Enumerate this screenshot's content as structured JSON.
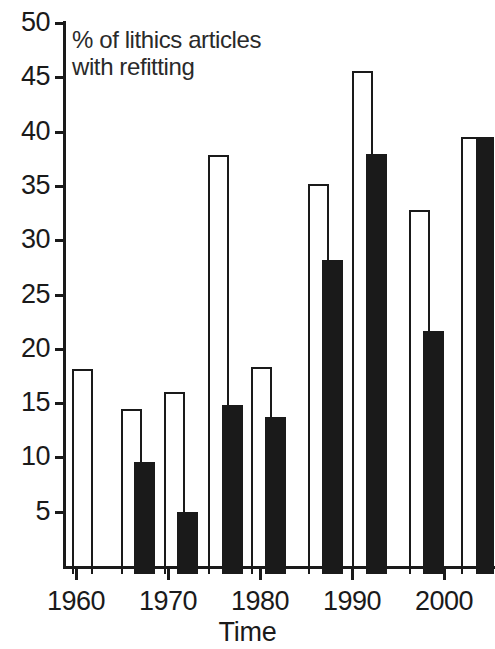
{
  "chart_data": {
    "type": "bar",
    "title": "",
    "annotation": "% of lithics articles with refitting",
    "xlabel": "Time",
    "ylabel": "",
    "xlim": [
      1958,
      2005
    ],
    "ylim": [
      0,
      50
    ],
    "y_ticks": [
      5,
      10,
      15,
      20,
      25,
      30,
      35,
      40,
      45,
      50
    ],
    "y_tick_labels": [
      "5",
      "10",
      "15",
      "20",
      "25",
      "30",
      "35",
      "40",
      "45",
      "50"
    ],
    "x_ticks": [
      1960,
      1970,
      1980,
      1990,
      2000
    ],
    "x_tick_labels": [
      "1960",
      "1970",
      "1980",
      "1990",
      "2000"
    ],
    "grid": false,
    "legend": "none",
    "series": [
      {
        "name": "open",
        "style": "open",
        "points": [
          {
            "x": 1961.5,
            "y": 18.9
          },
          {
            "x": 1966.9,
            "y": 15.2
          },
          {
            "x": 1971.6,
            "y": 16.8
          },
          {
            "x": 1976.4,
            "y": 38.6
          },
          {
            "x": 1981.1,
            "y": 19.1
          },
          {
            "x": 1986.6,
            "y": 35.9
          },
          {
            "x": 1991.3,
            "y": 46.3
          },
          {
            "x": 1996.4,
            "y": 33.5
          },
          {
            "x": 2001.8,
            "y": 40.2
          }
        ]
      },
      {
        "name": "filled",
        "style": "filled",
        "points": [
          {
            "x": 1968.3,
            "y": 10.3
          },
          {
            "x": 1973.0,
            "y": 5.7
          },
          {
            "x": 1977.8,
            "y": 15.6
          },
          {
            "x": 1982.5,
            "y": 14.5
          },
          {
            "x": 1988.0,
            "y": 28.9
          },
          {
            "x": 1992.7,
            "y": 38.7
          },
          {
            "x": 1997.8,
            "y": 22.4
          },
          {
            "x": 2003.2,
            "y": 40.2
          }
        ]
      }
    ],
    "bars": [
      {
        "label": "1961",
        "value": 18.9,
        "style": "open",
        "left": 72,
        "width": 21
      },
      {
        "label": "1967",
        "value": 15.2,
        "style": "open",
        "left": 121,
        "width": 21
      },
      {
        "label": "1968",
        "value": 10.3,
        "style": "filled",
        "left": 134,
        "width": 21
      },
      {
        "label": "1972",
        "value": 16.8,
        "style": "open",
        "left": 164,
        "width": 21
      },
      {
        "label": "1973",
        "value": 5.7,
        "style": "filled",
        "left": 177,
        "width": 21
      },
      {
        "label": "1976",
        "value": 38.6,
        "style": "open",
        "left": 208,
        "width": 21
      },
      {
        "label": "1978",
        "value": 15.6,
        "style": "filled",
        "left": 222,
        "width": 21
      },
      {
        "label": "1981",
        "value": 19.1,
        "style": "open",
        "left": 251,
        "width": 21
      },
      {
        "label": "1983",
        "value": 14.5,
        "style": "filled",
        "left": 265,
        "width": 21
      },
      {
        "label": "1987",
        "value": 35.9,
        "style": "open",
        "left": 308,
        "width": 21
      },
      {
        "label": "1988",
        "value": 28.9,
        "style": "filled",
        "left": 322,
        "width": 21
      },
      {
        "label": "1991",
        "value": 46.3,
        "style": "open",
        "left": 352,
        "width": 21
      },
      {
        "label": "1993",
        "value": 38.7,
        "style": "filled",
        "left": 366,
        "width": 21
      },
      {
        "label": "1996",
        "value": 33.5,
        "style": "open",
        "left": 409,
        "width": 21
      },
      {
        "label": "1998",
        "value": 22.4,
        "style": "filled",
        "left": 423,
        "width": 21
      },
      {
        "label": "2002",
        "value": 40.2,
        "style": "open",
        "left": 461,
        "width": 17
      },
      {
        "label": "2003",
        "value": 40.2,
        "style": "filled",
        "left": 477,
        "width": 17
      }
    ],
    "colors": {
      "open_fill": "#ffffff",
      "open_stroke": "#1a1a1a",
      "filled": "#1a1a1a",
      "axis": "#1a1a1a",
      "background": "#ffffff"
    }
  }
}
